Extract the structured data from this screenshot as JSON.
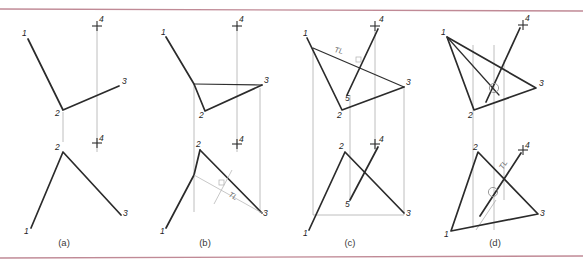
{
  "figure": {
    "panel_captions": [
      "(a)",
      "(b)",
      "(c)",
      "(d)"
    ],
    "point_labels": [
      "1",
      "2",
      "3",
      "4",
      "5"
    ],
    "true_length_label": "TL",
    "colors": {
      "object_line": "#2b2b2b",
      "projection_line": "#a8a8a8",
      "rule_line": "#c08a96",
      "label_text": "#1d1d1d",
      "background": "#ffffff"
    }
  },
  "panels": {
    "a": {
      "caption": "(a)",
      "labels": {
        "top_1": "1",
        "top_2": "2",
        "top_3": "3",
        "top_4": "4",
        "front_2": "2",
        "front_4": "4",
        "front_1": "1",
        "front_3": "3"
      }
    },
    "b": {
      "caption": "(b)",
      "labels": {
        "top_1": "1",
        "top_2": "2",
        "top_3": "3",
        "top_4": "4",
        "front_2": "2",
        "front_4": "4",
        "front_1": "1",
        "front_3": "3",
        "tl": "TL"
      }
    },
    "c": {
      "caption": "(c)",
      "labels": {
        "top_1": "1",
        "top_2": "2",
        "top_3": "3",
        "top_4": "4",
        "top_5": "5",
        "front_2": "2",
        "front_4": "4",
        "front_5": "5",
        "front_1": "1",
        "front_3": "3",
        "tl": "TL"
      }
    },
    "d": {
      "caption": "(d)",
      "labels": {
        "top_1": "1",
        "top_2": "2",
        "top_3": "3",
        "top_4": "4",
        "front_2": "2",
        "front_4": "4",
        "front_1": "1",
        "front_3": "3",
        "tl": "TL"
      }
    }
  }
}
